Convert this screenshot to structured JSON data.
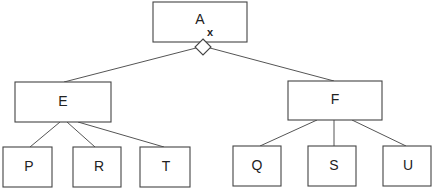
{
  "diagram": {
    "type": "tree",
    "root": {
      "label": "A",
      "annotation": "x",
      "connector": "diamond"
    },
    "level1": [
      {
        "label": "E",
        "children": [
          "P",
          "R",
          "T"
        ]
      },
      {
        "label": "F",
        "children": [
          "Q",
          "S",
          "U"
        ]
      }
    ],
    "nodes": {
      "A": "A",
      "E": "E",
      "F": "F",
      "P": "P",
      "R": "R",
      "T": "T",
      "Q": "Q",
      "S": "S",
      "U": "U"
    },
    "colors": {
      "stroke": "#444444",
      "text": "#222222",
      "background": "#ffffff"
    }
  }
}
